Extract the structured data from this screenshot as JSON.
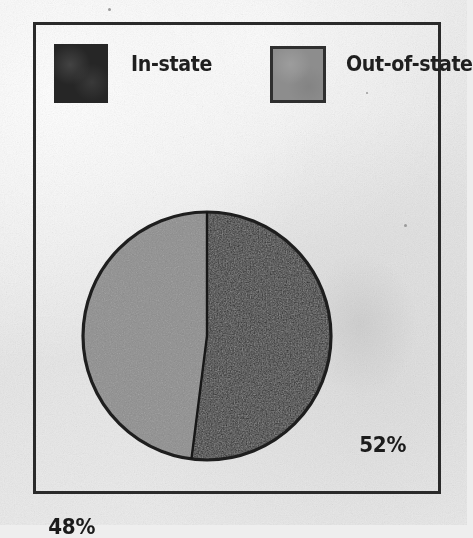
{
  "chart_data": {
    "type": "pie",
    "title": "",
    "categories": [
      "In-state",
      "Out-of-state"
    ],
    "values": [
      52,
      48
    ],
    "value_labels": [
      "52%",
      "48%"
    ],
    "units": "percent",
    "start_angle_deg": 0,
    "direction": "clockwise",
    "legend_position": "top",
    "grid": false,
    "series": [
      {
        "name": "Enrollment share",
        "slices": [
          {
            "label": "In-state",
            "value": 52,
            "display": "52%",
            "color": "#262626"
          },
          {
            "label": "Out-of-state",
            "value": 48,
            "display": "48%",
            "color": "#8d8d8d"
          }
        ]
      }
    ]
  },
  "legend": {
    "entries": [
      {
        "label": "In-state",
        "swatch_color": "#262626",
        "swatch_border": "none"
      },
      {
        "label": "Out-of-state",
        "swatch_color": "#8d8d8d",
        "swatch_border": "#2f2f2f"
      }
    ]
  },
  "labels": {
    "in_state_percent": "52%",
    "out_of_state_percent": "48%"
  },
  "colors": {
    "in_state": "#262626",
    "out_of_state": "#8d8d8d",
    "frame_border": "#2a2a2a",
    "pie_outline": "#1e1e1e",
    "paper": "#ececec",
    "text": "#1f1f1f"
  }
}
